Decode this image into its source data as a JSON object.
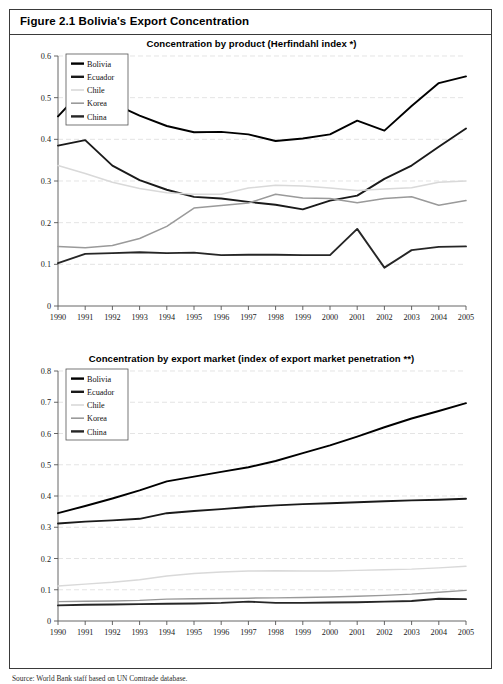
{
  "figure": {
    "title": "Figure 2.1 Bolivia's Export Concentration",
    "source_note": "Source: World Bank staff based on UN Comtrade database."
  },
  "series_style": {
    "Bolivia": "#000000",
    "Ecuador": "#1a1a1a",
    "Chile": "#d9d9d9",
    "Korea": "#9a9a9a",
    "China": "#262626"
  },
  "legend": {
    "items": [
      "Bolivia",
      "Ecuador",
      "Chile",
      "Korea",
      "China"
    ]
  },
  "chart_data": [
    {
      "type": "line",
      "title": "Concentration by product (Herfindahl index *)",
      "xlabel": "",
      "ylabel": "",
      "grid": true,
      "legend_position": "top-left",
      "x": [
        1990,
        1991,
        1992,
        1993,
        1994,
        1995,
        1996,
        1997,
        1998,
        1999,
        2000,
        2001,
        2002,
        2003,
        2004,
        2005
      ],
      "xlim": [
        1990,
        2005
      ],
      "ylim": [
        0,
        0.6
      ],
      "yticks": [
        0,
        0.1,
        0.2,
        0.3,
        0.4,
        0.5,
        0.6
      ],
      "ytick_labels": [
        "0",
        "0.1",
        "0.2",
        "0.3",
        "0.4",
        "0.5",
        "0.6"
      ],
      "categories": [
        "1990",
        "1991",
        "1992",
        "1993",
        "1994",
        "1995",
        "1996",
        "1997",
        "1998",
        "1999",
        "2000",
        "2001",
        "2002",
        "2003",
        "2004",
        "2005"
      ],
      "series": [
        {
          "name": "Bolivia",
          "values": [
            0.455,
            0.525,
            0.487,
            0.457,
            0.432,
            0.417,
            0.418,
            0.412,
            0.396,
            0.402,
            0.412,
            0.445,
            0.421,
            0.48,
            0.535,
            0.551
          ]
        },
        {
          "name": "Ecuador",
          "values": [
            0.385,
            0.398,
            0.337,
            0.302,
            0.279,
            0.262,
            0.258,
            0.25,
            0.243,
            0.232,
            0.253,
            0.265,
            0.305,
            0.337,
            0.382,
            0.426
          ]
        },
        {
          "name": "Chile",
          "values": [
            0.337,
            0.318,
            0.297,
            0.282,
            0.272,
            0.268,
            0.268,
            0.283,
            0.29,
            0.288,
            0.283,
            0.277,
            0.281,
            0.284,
            0.297,
            0.3
          ]
        },
        {
          "name": "Korea",
          "values": [
            0.143,
            0.14,
            0.145,
            0.162,
            0.191,
            0.235,
            0.241,
            0.247,
            0.268,
            0.259,
            0.258,
            0.248,
            0.258,
            0.262,
            0.242,
            0.253
          ]
        },
        {
          "name": "China",
          "values": [
            0.103,
            0.125,
            0.127,
            0.129,
            0.127,
            0.128,
            0.122,
            0.123,
            0.123,
            0.122,
            0.122,
            0.185,
            0.092,
            0.134,
            0.142,
            0.143
          ]
        }
      ]
    },
    {
      "type": "line",
      "title": "Concentration by export market (index of export market penetration **)",
      "xlabel": "",
      "ylabel": "",
      "grid": true,
      "legend_position": "top-left",
      "x": [
        1990,
        1991,
        1992,
        1993,
        1994,
        1995,
        1996,
        1997,
        1998,
        1999,
        2000,
        2001,
        2002,
        2003,
        2004,
        2005
      ],
      "xlim": [
        1990,
        2005
      ],
      "ylim": [
        0,
        0.8
      ],
      "yticks": [
        0,
        0.1,
        0.2,
        0.3,
        0.4,
        0.5,
        0.6,
        0.7,
        0.8
      ],
      "ytick_labels": [
        "0",
        "0.1",
        "0.2",
        "0.3",
        "0.4",
        "0.5",
        "0.6",
        "0.7",
        "0.8"
      ],
      "categories": [
        "1990",
        "1991",
        "1992",
        "1993",
        "1994",
        "1995",
        "1996",
        "1997",
        "1998",
        "1999",
        "2000",
        "2001",
        "2002",
        "2003",
        "2004",
        "2005"
      ],
      "series": [
        {
          "name": "Bolivia",
          "values": [
            0.345,
            0.368,
            0.392,
            0.418,
            0.447,
            0.462,
            0.477,
            0.492,
            0.512,
            0.537,
            0.562,
            0.59,
            0.62,
            0.648,
            0.672,
            0.697
          ]
        },
        {
          "name": "Ecuador",
          "values": [
            0.312,
            0.318,
            0.322,
            0.327,
            0.345,
            0.352,
            0.358,
            0.365,
            0.37,
            0.374,
            0.377,
            0.38,
            0.383,
            0.386,
            0.388,
            0.391
          ]
        },
        {
          "name": "Chile",
          "values": [
            0.112,
            0.118,
            0.124,
            0.132,
            0.144,
            0.152,
            0.157,
            0.16,
            0.161,
            0.16,
            0.16,
            0.162,
            0.164,
            0.166,
            0.17,
            0.175
          ]
        },
        {
          "name": "Korea",
          "values": [
            0.062,
            0.063,
            0.064,
            0.066,
            0.07,
            0.071,
            0.072,
            0.073,
            0.074,
            0.075,
            0.077,
            0.079,
            0.082,
            0.086,
            0.092,
            0.098
          ]
        },
        {
          "name": "China",
          "values": [
            0.05,
            0.052,
            0.053,
            0.054,
            0.055,
            0.056,
            0.058,
            0.062,
            0.058,
            0.058,
            0.059,
            0.06,
            0.062,
            0.064,
            0.071,
            0.07
          ]
        }
      ]
    }
  ]
}
